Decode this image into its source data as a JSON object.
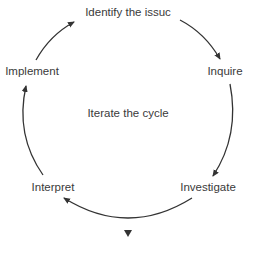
{
  "diagram": {
    "type": "cycle",
    "center_label": "Iterate the cycle",
    "nodes": [
      {
        "id": "identify",
        "label": "Identify the issuc"
      },
      {
        "id": "inquire",
        "label": "Inquire"
      },
      {
        "id": "investigate",
        "label": "Investigate"
      },
      {
        "id": "interpret",
        "label": "Interpret"
      },
      {
        "id": "implement",
        "label": "Implement"
      }
    ],
    "edges": [
      {
        "from": "identify",
        "to": "inquire"
      },
      {
        "from": "inquire",
        "to": "investigate"
      },
      {
        "from": "investigate",
        "to": "interpret"
      },
      {
        "from": "interpret",
        "to": "implement"
      },
      {
        "from": "implement",
        "to": "identify"
      }
    ],
    "arrow_color": "#333333",
    "text_color": "#3a3a3a",
    "footer_marker": "triangle-down"
  }
}
